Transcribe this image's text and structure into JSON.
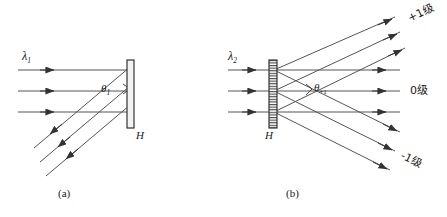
{
  "figure": {
    "panels": [
      {
        "id": "a",
        "caption": "(a)",
        "source_label": "λ",
        "source_sub": "1",
        "angle_label": "θ",
        "angle_sub": "1",
        "plate_label": "H",
        "description": "hologram plate with single diffracted beam"
      },
      {
        "id": "b",
        "caption": "(b)",
        "source_label": "λ",
        "source_sub": "2",
        "angle_label": "θ",
        "angle_sub": "+1",
        "plate_label": "H",
        "description": "grating with three diffraction orders"
      }
    ],
    "orders": [
      {
        "key": "plus1",
        "label": "+1级"
      },
      {
        "key": "zero",
        "label": "0级"
      },
      {
        "key": "minus1",
        "label": "-1级"
      }
    ],
    "colors": {
      "stroke": "#333333",
      "ray": "#555555",
      "plate_fill": "#f2f2f2",
      "background": "#ffffff"
    }
  }
}
